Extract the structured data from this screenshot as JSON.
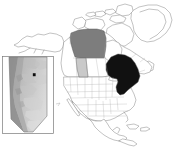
{
  "figure": {
    "type": "locator-map",
    "background_color": "#ffffff"
  },
  "main_map": {
    "name": "north-america-map",
    "projection_hint": "lambert-conformal-conic",
    "outline_color": "#6f6f6f",
    "internal_border_color": "#9a9a9a",
    "fill_color": "#ffffff",
    "extent_note": "Alaska, Canada, Greenland, conterminous United States, Mexico and Central America",
    "highlighted_regions": [
      {
        "id": "northwest-territories",
        "label": "Northwest Territories",
        "fill": "#7d7d7d",
        "role": "dark-gray-highlight"
      },
      {
        "id": "alberta",
        "label": "Alberta",
        "fill": "#c9c9c9",
        "role": "light-gray-highlight"
      },
      {
        "id": "ontario",
        "label": "Ontario",
        "fill": "#111111",
        "role": "black-highlight"
      }
    ],
    "unhighlighted_note": "All other provinces, states and countries drawn as white polygons with thin gray outlines"
  },
  "inset_map": {
    "name": "alberta-inset",
    "label": "Alberta",
    "frame_color": "#7a7a7a",
    "frame_visible": true,
    "raster_type": "grayscale terrain / elevation shading",
    "raster_legend": {
      "high_color": "#8e8e8e",
      "mid_color": "#b5b5b5",
      "low_color": "#dcdcdc",
      "description": "Darker gray along the western Rocky Mountain cordillera, lighter gray across the eastern plains"
    },
    "site_marker": {
      "name": "study-site-marker",
      "shape": "square",
      "color": "#0d0d0d",
      "x_fraction": 0.62,
      "y_fraction": 0.24,
      "label": ""
    }
  },
  "chart_data": {
    "type": "map",
    "legend": [
      {
        "label": "Northwest Territories",
        "color": "#7d7d7d"
      },
      {
        "label": "Alberta",
        "color": "#c9c9c9"
      },
      {
        "label": "Ontario",
        "color": "#111111"
      },
      {
        "label": "Study site",
        "color": "#0d0d0d"
      }
    ],
    "annotations": []
  }
}
